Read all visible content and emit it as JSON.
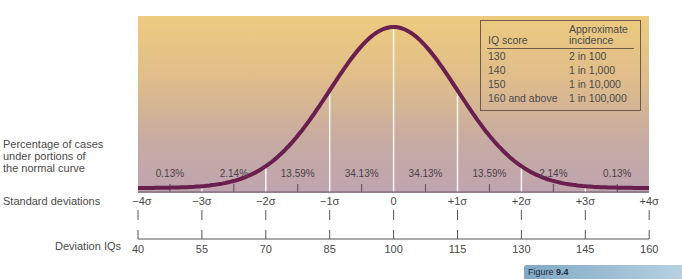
{
  "chart_data": {
    "type": "line",
    "figure_label": {
      "prefix": "Figure",
      "number": "9.4"
    },
    "x": [
      -4,
      -3,
      -2,
      -1,
      0,
      1,
      2,
      3,
      4
    ],
    "series": [
      {
        "name": "Normal curve",
        "description": "Standard normal density, peak at 0"
      }
    ],
    "regions": [
      {
        "from": -4,
        "to": -3,
        "percent": "0.13%"
      },
      {
        "from": -3,
        "to": -2,
        "percent": "2.14%"
      },
      {
        "from": -2,
        "to": -1,
        "percent": "13.59%"
      },
      {
        "from": -1,
        "to": 0,
        "percent": "34.13%"
      },
      {
        "from": 0,
        "to": 1,
        "percent": "34.13%"
      },
      {
        "from": 1,
        "to": 2,
        "percent": "13.59%"
      },
      {
        "from": 2,
        "to": 3,
        "percent": "2.14%"
      },
      {
        "from": 3,
        "to": 4,
        "percent": "0.13%"
      }
    ],
    "left_label": [
      "Percentage of cases",
      "under portions of",
      "the normal curve"
    ],
    "axes": [
      {
        "title": "Standard deviations",
        "ticks": [
          "−4σ",
          "−3σ",
          "−2σ",
          "−1σ",
          "0",
          "+1σ",
          "+2σ",
          "+3σ",
          "+4σ"
        ]
      },
      {
        "title": "Deviation IQs",
        "ticks": [
          "40",
          "55",
          "70",
          "85",
          "100",
          "115",
          "130",
          "145",
          "160"
        ]
      }
    ],
    "table": {
      "headers": [
        "IQ score",
        "Approximate incidence"
      ],
      "header_lines": {
        "col1": "IQ score",
        "col2_line1": "Approximate",
        "col2_line2": "incidence"
      },
      "rows": [
        [
          "130",
          "2 in 100"
        ],
        [
          "140",
          "1 in 1,000"
        ],
        [
          "150",
          "1 in 10,000"
        ],
        [
          "160 and above",
          "1 in 100,000"
        ]
      ]
    },
    "colors": {
      "curve": "#6a1f4f",
      "bg_top": "#edcb7f",
      "bg_bottom": "#bfa4b0",
      "divider": "#ffffff"
    }
  }
}
